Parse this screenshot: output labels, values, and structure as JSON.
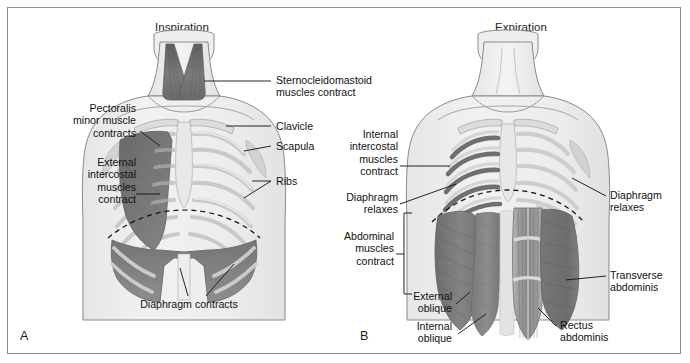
{
  "figure": {
    "domain_note": "two-panel anatomical illustration of respiratory muscles",
    "frame_border_color": "#8c8c8c",
    "background_color": "#ffffff",
    "palette": {
      "body_outline": "#8a8a8a",
      "body_fill": "#eeeeee",
      "bone_light": "#dcdcdc",
      "bone_mid": "#c6c6c6",
      "muscle_dark": "#6f6f6f",
      "muscle_mid": "#8f8f8f",
      "muscle_light": "#b4b4b4",
      "leader_line": "#1a1a1a",
      "dashed_line": "#111111"
    }
  },
  "panel_a": {
    "title": "Inspiration",
    "letter": "A",
    "labels": {
      "sternocleidomastoid": "Sternocleidomastoid\nmuscles contract",
      "clavicle": "Clavicle",
      "scapula": "Scapula",
      "ribs": "Ribs",
      "pectoralis_minor": "Pectoralis\nminor muscle\ncontracts",
      "external_intercostal": "External\nintercostal\nmuscles\ncontract",
      "diaphragm": "Diaphragm contracts"
    }
  },
  "panel_b": {
    "title": "Expiration",
    "letter": "B",
    "labels": {
      "internal_intercostal": "Internal\nintercostal\nmuscles\ncontract",
      "diaphragm_relaxes_left": "Diaphragm\nrelaxes",
      "diaphragm_relaxes_right": "Diaphragm\nrelaxes",
      "abdominal_muscles": "Abdominal\nmuscles\ncontract",
      "external_oblique": "External\noblique",
      "internal_oblique": "Internal\noblique",
      "transverse_abdominis": "Transverse\nabdominis",
      "rectus_abdominis": "Rectus\nabdominis"
    }
  }
}
